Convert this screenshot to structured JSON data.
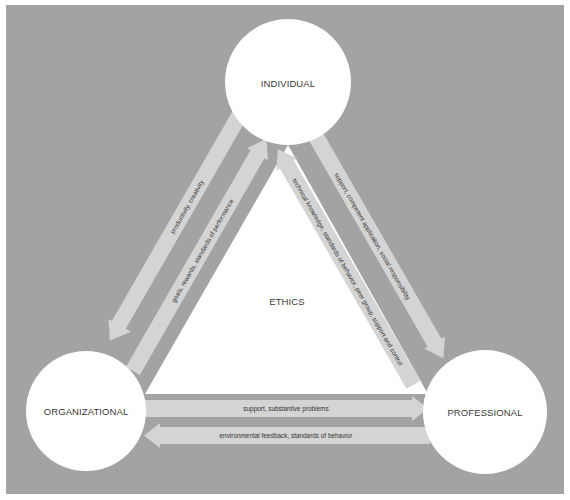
{
  "diagram": {
    "colors": {
      "background": "#a3a3a3",
      "band": "#d4d4d4",
      "node_fill": "#ffffff",
      "center_fill": "#ffffff",
      "text": "#3a3a3a"
    },
    "center": {
      "label": "ETHICS"
    },
    "nodes": [
      {
        "id": "individual",
        "label": "INDIVIDUAL"
      },
      {
        "id": "organizational",
        "label": "ORGANIZATIONAL"
      },
      {
        "id": "professional",
        "label": "PROFESSIONAL"
      }
    ],
    "flows": [
      {
        "from": "individual",
        "to": "organizational",
        "label": "productivity, creativity"
      },
      {
        "from": "organizational",
        "to": "individual",
        "label": "goals, rewards, standards of performance"
      },
      {
        "from": "individual",
        "to": "professional",
        "label": "support, competent application, social responsibility"
      },
      {
        "from": "professional",
        "to": "individual",
        "label": "technical knowledge, standards of behavior, peer group, support and control"
      },
      {
        "from": "organizational",
        "to": "professional",
        "label": "support, substantive problems"
      },
      {
        "from": "professional",
        "to": "organizational",
        "label": "environmental feedback, standards of behavior"
      }
    ]
  }
}
